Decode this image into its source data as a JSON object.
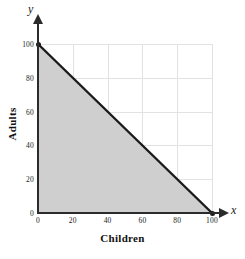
{
  "chart_data": {
    "type": "line",
    "title": "",
    "subtitle": "",
    "xlabel": "Children",
    "ylabel": "Adults",
    "x_var": "x",
    "y_var": "y",
    "xlim": [
      0,
      100
    ],
    "ylim": [
      0,
      100
    ],
    "xticks": [
      0,
      20,
      40,
      60,
      80,
      100
    ],
    "yticks": [
      0,
      20,
      40,
      60,
      80,
      100
    ],
    "xtick_labels": [
      "0",
      "20",
      "40",
      "60",
      "80",
      "100"
    ],
    "ytick_labels": [
      "0",
      "20",
      "40",
      "60",
      "80",
      "100"
    ],
    "grid": true,
    "grid_interval": 20,
    "legend": "none",
    "series": [
      {
        "name": "boundary-line",
        "kind": "line",
        "x": [
          0,
          100
        ],
        "y": [
          100,
          0
        ],
        "endpoints_marked": true,
        "endpoint_style": "filled-circle",
        "equation": "x + y = 100",
        "color": "#1a1a1a",
        "line_width": 2
      },
      {
        "name": "shaded-region",
        "kind": "area",
        "description": "region bounded by x >= 0, y >= 0, x + y <= 100",
        "vertices": [
          [
            0,
            0
          ],
          [
            100,
            0
          ],
          [
            0,
            100
          ]
        ],
        "color": "#cfcfcf"
      }
    ],
    "annotations": []
  },
  "axes": {
    "x_variable_label": "x",
    "y_variable_label": "y",
    "x_title": "Children",
    "y_title": "Adults"
  },
  "colors": {
    "shade": "#cfcfcf",
    "line": "#1a1a1a",
    "grid": "#e2e2e2",
    "axis": "#2b2b2b",
    "text": "#1a1a1a",
    "background": "#ffffff"
  }
}
